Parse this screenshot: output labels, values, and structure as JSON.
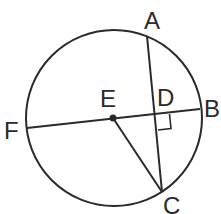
{
  "diagram": {
    "type": "circle-geometry",
    "stroke_color": "#2a2a2a",
    "background": "#ffffff",
    "circle": {
      "center": "E",
      "cx": 114,
      "cy": 118,
      "r": 88
    },
    "points": {
      "A": {
        "label": "A",
        "x": 147,
        "y": 36
      },
      "B": {
        "label": "B",
        "x": 200,
        "y": 109
      },
      "C": {
        "label": "C",
        "x": 162,
        "y": 192
      },
      "D": {
        "label": "D",
        "x": 156,
        "y": 113
      },
      "E": {
        "label": "E",
        "x": 113,
        "y": 118
      },
      "F": {
        "label": "F",
        "x": 27,
        "y": 128
      }
    },
    "segments": [
      "FB",
      "AC",
      "EC"
    ],
    "right_angle_at": "D"
  }
}
